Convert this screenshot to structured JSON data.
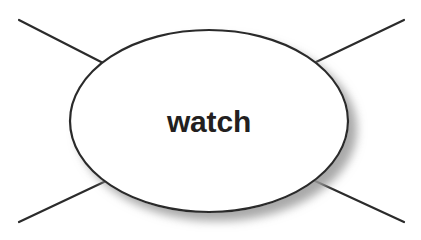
{
  "canvas": {
    "width": 421,
    "height": 240,
    "background_color": "#ffffff"
  },
  "diagram": {
    "type": "node-link-diagram",
    "title": "watch",
    "node": {
      "id": "watch-node",
      "shape": "ellipse",
      "label": "watch",
      "center_x": 209,
      "center_y": 121,
      "radius_x": 139,
      "radius_y": 91,
      "fill_color": "#ffffff",
      "stroke_color": "#2b2b2b",
      "stroke_width": 2.2,
      "label_color": "#231f20",
      "label_font_size": 30,
      "label_font_weight": "bold",
      "shadow_color": "#9a9a9a",
      "shadow_offset_x": 8,
      "shadow_offset_y": 8,
      "shadow_blur": 9
    },
    "edges": [
      {
        "id": "edge-top-left",
        "name": "connector-top-left",
        "x1": 19,
        "y1": 20,
        "x2": 107,
        "y2": 65,
        "stroke_color": "#2b2b2b",
        "stroke_width": 2.2
      },
      {
        "id": "edge-top-right",
        "name": "connector-top-right",
        "x1": 404,
        "y1": 20,
        "x2": 314,
        "y2": 63,
        "stroke_color": "#2b2b2b",
        "stroke_width": 2.2
      },
      {
        "id": "edge-bottom-left",
        "name": "connector-bottom-left",
        "x1": 19,
        "y1": 222,
        "x2": 106,
        "y2": 181,
        "stroke_color": "#2b2b2b",
        "stroke_width": 2.2
      },
      {
        "id": "edge-bottom-right",
        "name": "connector-bottom-right",
        "x1": 404,
        "y1": 222,
        "x2": 313,
        "y2": 180,
        "stroke_color": "#2b2b2b",
        "stroke_width": 2.2
      }
    ]
  }
}
